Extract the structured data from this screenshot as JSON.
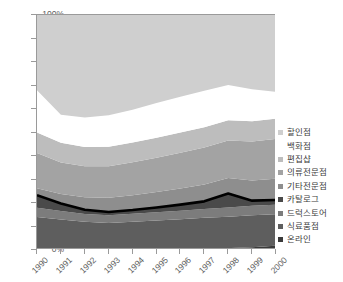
{
  "chart_data": {
    "type": "area",
    "stacked": true,
    "normalized": true,
    "title": "",
    "subtitle": "",
    "xlabel": "",
    "ylabel": "",
    "grid": false,
    "legend_position": "right",
    "x": [
      1990,
      1991,
      1992,
      1993,
      1994,
      1995,
      1996,
      1997,
      1998,
      1999,
      2000
    ],
    "xtick_labels": [
      "1990",
      "1991",
      "1992",
      "1993",
      "1994",
      "1995",
      "1996",
      "1997",
      "1998",
      "1999",
      "2000"
    ],
    "ylim": [
      0,
      100
    ],
    "ytick_labels": [
      "0%",
      "10%",
      "20%",
      "30%",
      "40%",
      "50%",
      "60%",
      "70%",
      "80%",
      "90%",
      "100%"
    ],
    "ytick_values": [
      0,
      10,
      20,
      30,
      40,
      50,
      60,
      70,
      80,
      90,
      100
    ],
    "series": [
      {
        "name": "온라인",
        "color": "#3a3a3a",
        "values": [
          0.4,
          0.4,
          0.4,
          0.4,
          0.4,
          0.5,
          0.5,
          0.6,
          0.8,
          1.2,
          1.8
        ]
      },
      {
        "name": "식료품점",
        "color": "#5e5e5e",
        "values": [
          13.6,
          12.6,
          11.6,
          11.1,
          11.6,
          12.1,
          12.6,
          13.1,
          13.4,
          13.6,
          13.4
        ]
      },
      {
        "name": "드럭스토어",
        "color": "#7c7c7c",
        "values": [
          4.0,
          3.6,
          3.3,
          3.3,
          3.4,
          3.5,
          3.6,
          3.8,
          3.9,
          4.0,
          4.1
        ]
      },
      {
        "name": "카탈로그",
        "color": "#4a4a4a",
        "values": [
          5.3,
          3.2,
          1.8,
          1.4,
          1.6,
          2.0,
          2.6,
          3.2,
          5.9,
          2.2,
          2.0
        ]
      },
      {
        "name": "기타전문점",
        "color": "#8e8e8e",
        "values": [
          3.0,
          4.0,
          5.3,
          6.0,
          6.3,
          6.6,
          6.9,
          7.2,
          6.6,
          8.6,
          9.0
        ]
      },
      {
        "name": "의류전문점",
        "color": "#a3a3a3",
        "values": [
          15.0,
          13.4,
          13.2,
          13.4,
          14.0,
          14.6,
          15.2,
          15.7,
          16.0,
          16.6,
          17.0
        ]
      },
      {
        "name": "편집샵",
        "color": "#bdbdbd",
        "values": [
          8.7,
          8.4,
          8.2,
          8.3,
          8.4,
          8.5,
          8.6,
          8.6,
          8.6,
          8.6,
          8.6
        ]
      },
      {
        "name": "백화점",
        "color": "#ffffff",
        "values": [
          18.0,
          12.0,
          12.6,
          13.4,
          14.0,
          14.8,
          15.2,
          15.6,
          15.0,
          13.6,
          11.4
        ]
      },
      {
        "name": "할인점",
        "color": "#cfcfcf",
        "values": [
          32.0,
          42.4,
          43.6,
          42.7,
          40.3,
          37.4,
          34.8,
          32.2,
          29.8,
          31.6,
          32.7
        ]
      }
    ],
    "cumulative_tops": {
      "온라인": [
        0.4,
        0.4,
        0.4,
        0.4,
        0.4,
        0.5,
        0.5,
        0.6,
        0.8,
        1.2,
        1.8
      ],
      "식료품점": [
        14.0,
        13.0,
        12.0,
        11.5,
        12.0,
        12.6,
        13.1,
        13.7,
        14.2,
        14.8,
        15.2
      ],
      "드럭스토어": [
        18.0,
        16.6,
        15.3,
        14.8,
        15.4,
        16.1,
        16.7,
        17.5,
        18.1,
        18.8,
        19.3
      ],
      "카탈로그": [
        23.3,
        19.8,
        17.1,
        16.2,
        17.0,
        18.1,
        19.3,
        20.7,
        24.0,
        21.0,
        21.3
      ],
      "기타전문점": [
        26.3,
        23.8,
        22.4,
        22.2,
        23.3,
        24.7,
        26.2,
        27.9,
        30.6,
        29.6,
        30.3
      ],
      "의류전문점": [
        41.3,
        37.2,
        35.6,
        35.6,
        37.3,
        39.3,
        41.4,
        43.6,
        46.6,
        46.2,
        47.3
      ],
      "편집샵": [
        50.0,
        45.6,
        43.8,
        43.9,
        45.7,
        47.8,
        50.0,
        52.2,
        55.2,
        54.8,
        55.9
      ],
      "백화점": [
        68.0,
        57.6,
        56.4,
        57.3,
        59.7,
        62.6,
        65.2,
        67.8,
        70.2,
        68.4,
        67.3
      ],
      "할인점": [
        100,
        100,
        100,
        100,
        100,
        100,
        100,
        100,
        100,
        100,
        100
      ]
    },
    "highlight_line": {
      "name": "카탈로그",
      "color": "#000000",
      "values": [
        23.3,
        19.8,
        17.1,
        16.2,
        17.0,
        18.1,
        19.3,
        20.7,
        24.0,
        21.0,
        21.3
      ]
    }
  },
  "legend": {
    "items": [
      {
        "label": "할인점",
        "color": "#cfcfcf",
        "swatch": true
      },
      {
        "label": "백화점",
        "color": "#ffffff",
        "swatch": false
      },
      {
        "label": "편집샵",
        "color": "#bdbdbd",
        "swatch": true
      },
      {
        "label": "의류전문점",
        "color": "#a3a3a3",
        "swatch": true
      },
      {
        "label": "기타전문점",
        "color": "#8e8e8e",
        "swatch": true
      },
      {
        "label": "카탈로그",
        "color": "#4a4a4a",
        "swatch": true
      },
      {
        "label": "드럭스토어",
        "color": "#7c7c7c",
        "swatch": true
      },
      {
        "label": "식료품점",
        "color": "#5e5e5e",
        "swatch": true
      },
      {
        "label": "온라인",
        "color": "#3a3a3a",
        "swatch": true
      }
    ]
  },
  "axis": {
    "y_labels": [
      "100%",
      "90%",
      "80%",
      "70%",
      "60%",
      "50%",
      "40%",
      "30%",
      "20%",
      "10%",
      "0%"
    ],
    "x_labels": [
      "1990",
      "1991",
      "1992",
      "1993",
      "1994",
      "1995",
      "1996",
      "1997",
      "1998",
      "1999",
      "2000"
    ]
  }
}
